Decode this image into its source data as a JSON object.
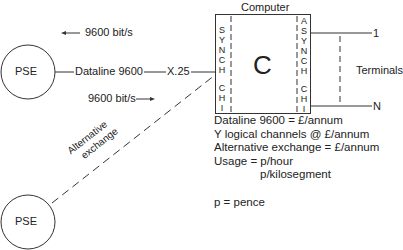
{
  "diagram": {
    "pse_top": {
      "label": "PSE"
    },
    "pse_bottom": {
      "label": "PSE"
    },
    "computer": {
      "title": "Computer",
      "center_label": "C"
    },
    "synch_channel_letters": [
      "S",
      "Y",
      "N",
      "C",
      "H",
      "",
      "C",
      "H",
      "I"
    ],
    "asynch_channel_letters": [
      "A",
      "S",
      "Y",
      "N",
      "C",
      "H",
      "",
      "C",
      "H",
      "I"
    ],
    "dataline_label": "Dataline 9600",
    "protocol_label": "X.25",
    "rate_inbound": {
      "arrow": "←",
      "label": "9600 bit/s"
    },
    "rate_outbound": {
      "arrow": "→",
      "label": "9600 bit/s"
    },
    "alternative_line": {
      "line1": "Alternative",
      "line2": "exchange"
    },
    "terminals": {
      "label": "Terminals",
      "first": "1",
      "last": "N"
    }
  },
  "costs": {
    "lines": [
      "Dataline 9600 = £/annum",
      "Y logical channels @ £/annum",
      "Alternative exchange = £/annum",
      "Usage = p/hour"
    ],
    "usage_second": "p/kilosegment",
    "legend": "p = pence"
  }
}
